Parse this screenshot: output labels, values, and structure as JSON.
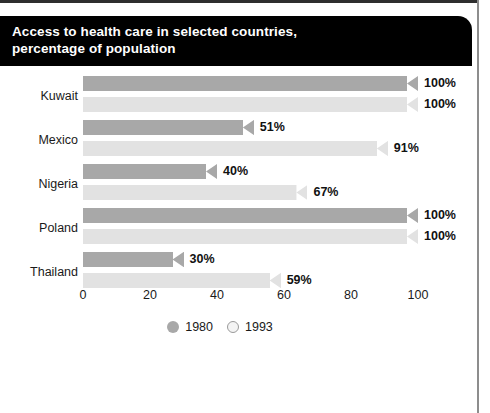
{
  "figure": {
    "title_line1": "Access to health care in selected countries,",
    "title_line2": "percentage of population",
    "title": "Access to health care in selected countries,\npercentage of population"
  },
  "colors": {
    "banner_bg": "#000000",
    "banner_text": "#ffffff",
    "series_1980": "#a8a8a8",
    "series_1993": "#e2e2e2",
    "axis_text": "#1a1a1a",
    "frame_line": "#8d8d8d"
  },
  "legend": {
    "position": "bottom-center",
    "items": [
      {
        "label": "1980",
        "marker": "filled-circle-icon",
        "color": "#a8a8a8"
      },
      {
        "label": "1993",
        "marker": "open-circle-icon",
        "color": "#f4f4f4"
      }
    ]
  },
  "axis": {
    "ticks": [
      "0",
      "20",
      "40",
      "60",
      "80",
      "100"
    ],
    "tick_values": [
      0,
      20,
      40,
      60,
      80,
      100
    ]
  },
  "rows": [
    {
      "category": "Kuwait",
      "bars": [
        {
          "series": "1980",
          "value": 100,
          "label": "100%"
        },
        {
          "series": "1993",
          "value": 100,
          "label": "100%"
        }
      ]
    },
    {
      "category": "Mexico",
      "bars": [
        {
          "series": "1980",
          "value": 51,
          "label": "51%"
        },
        {
          "series": "1993",
          "value": 91,
          "label": "91%"
        }
      ]
    },
    {
      "category": "Nigeria",
      "bars": [
        {
          "series": "1980",
          "value": 40,
          "label": "40%"
        },
        {
          "series": "1993",
          "value": 67,
          "label": "67%"
        }
      ]
    },
    {
      "category": "Poland",
      "bars": [
        {
          "series": "1980",
          "value": 100,
          "label": "100%"
        },
        {
          "series": "1993",
          "value": 100,
          "label": "100%"
        }
      ]
    },
    {
      "category": "Thailand",
      "bars": [
        {
          "series": "1980",
          "value": 30,
          "label": "30%"
        },
        {
          "series": "1993",
          "value": 59,
          "label": "59%"
        }
      ]
    }
  ],
  "chart_data": {
    "type": "bar",
    "orientation": "horizontal",
    "title": "Access to health care in selected countries, percentage of population",
    "xlabel": "",
    "ylabel": "",
    "xlim": [
      0,
      100
    ],
    "xticks": [
      0,
      20,
      40,
      60,
      80,
      100
    ],
    "grid": false,
    "legend_position": "bottom-center",
    "categories": [
      "Kuwait",
      "Mexico",
      "Nigeria",
      "Poland",
      "Thailand"
    ],
    "series": [
      {
        "name": "1980",
        "values": [
          100,
          51,
          40,
          100,
          30
        ],
        "color": "#a8a8a8"
      },
      {
        "name": "1993",
        "values": [
          100,
          91,
          67,
          100,
          59
        ],
        "color": "#e2e2e2"
      }
    ],
    "data_labels": [
      [
        "100%",
        "51%",
        "40%",
        "100%",
        "30%"
      ],
      [
        "100%",
        "91%",
        "67%",
        "100%",
        "59%"
      ]
    ]
  }
}
